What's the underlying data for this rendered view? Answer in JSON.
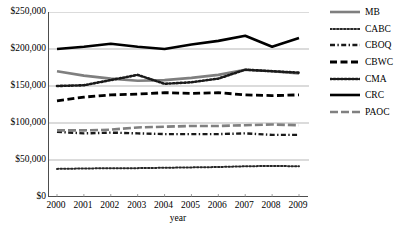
{
  "chart_data": {
    "type": "line",
    "title": "",
    "xlabel": "year",
    "ylabel": "",
    "x": [
      2000,
      2001,
      2002,
      2003,
      2004,
      2005,
      2006,
      2007,
      2008,
      2009
    ],
    "categories": [
      "2000",
      "2001",
      "2002",
      "2003",
      "2004",
      "2005",
      "2006",
      "2007",
      "2008",
      "2009"
    ],
    "ylim": [
      0,
      250000
    ],
    "yticks": [
      0,
      50000,
      100000,
      150000,
      200000,
      250000
    ],
    "ytick_labels": [
      "$0",
      "$50,000",
      "$100,000",
      "$150,000",
      "$200,000",
      "$250,000"
    ],
    "grid": "horizontal",
    "legend_position": "right",
    "series": [
      {
        "name": "MB",
        "style": "solid-thick-gray",
        "color": "#7f7f7f",
        "values": [
          170000,
          164000,
          160000,
          157000,
          158000,
          161000,
          165000,
          172000,
          170000,
          167000
        ]
      },
      {
        "name": "CABC",
        "style": "fine-dotted",
        "color": "#262626",
        "values": [
          38000,
          38500,
          39000,
          39000,
          39500,
          40000,
          40500,
          41500,
          42000,
          41500
        ]
      },
      {
        "name": "CBOQ",
        "style": "dash-dot",
        "color": "#1a1a1a",
        "values": [
          88000,
          86000,
          87000,
          86000,
          85000,
          85000,
          85000,
          86000,
          84000,
          84000
        ]
      },
      {
        "name": "CBWC",
        "style": "dashed-thick",
        "color": "#000000",
        "values": [
          130000,
          135000,
          138000,
          139000,
          141000,
          140000,
          141000,
          138000,
          137000,
          138000
        ]
      },
      {
        "name": "CMA",
        "style": "dotted-thick",
        "color": "#1a1a1a",
        "values": [
          150000,
          151000,
          158000,
          165000,
          153000,
          155000,
          160000,
          172000,
          170000,
          168000
        ]
      },
      {
        "name": "CRC",
        "style": "solid-thick-black",
        "color": "#000000",
        "values": [
          200000,
          203000,
          207000,
          203000,
          200000,
          206000,
          211000,
          218000,
          203000,
          215000
        ]
      },
      {
        "name": "PAOC",
        "style": "dashed-gray",
        "color": "#808080",
        "values": [
          90000,
          90000,
          91000,
          94000,
          95000,
          96000,
          96000,
          97000,
          98000,
          97000
        ]
      }
    ]
  },
  "axis": {
    "x_title": "year",
    "y_tick_labels": [
      "$250,000",
      "$200,000",
      "$150,000",
      "$100,000",
      "$50,000",
      "$0"
    ]
  },
  "legend": {
    "items": [
      {
        "label": "MB"
      },
      {
        "label": "CABC"
      },
      {
        "label": "CBOQ"
      },
      {
        "label": "CBWC"
      },
      {
        "label": "CMA"
      },
      {
        "label": "CRC"
      },
      {
        "label": "PAOC"
      }
    ]
  },
  "caption": {
    "sliver_text": ""
  }
}
